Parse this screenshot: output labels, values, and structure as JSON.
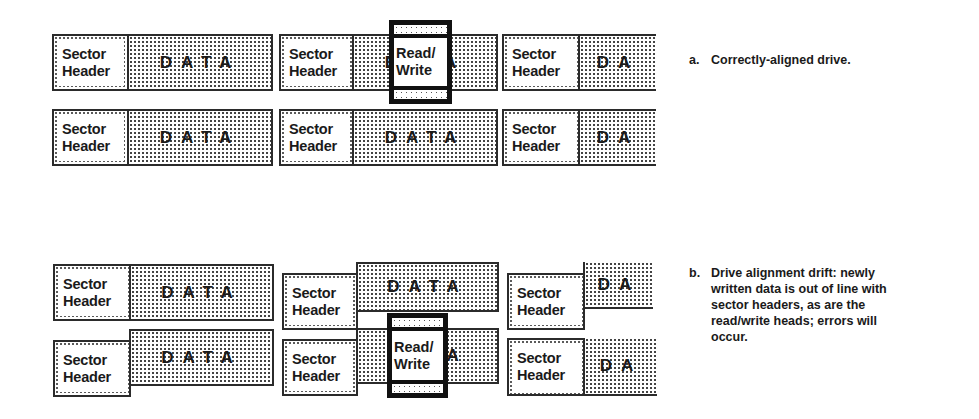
{
  "labels": {
    "sector_header_line1": "Sector",
    "sector_header_line2": "Header",
    "data_full": "DATA",
    "data_partial": "DA",
    "data_last_letter": "A",
    "data_first_letter": "D",
    "head_line1": "Read/",
    "head_line2": "Write"
  },
  "panel_a": {
    "marker": "a.",
    "caption": "Correctly-aligned drive."
  },
  "panel_b": {
    "marker": "b.",
    "caption": "Drive alignment drift: newly written data is out of line with sector headers, as are the read/write heads; errors will occur."
  },
  "colors": {
    "outline": "#2b2b2b",
    "head_outline": "#111111",
    "background": "#ffffff"
  }
}
